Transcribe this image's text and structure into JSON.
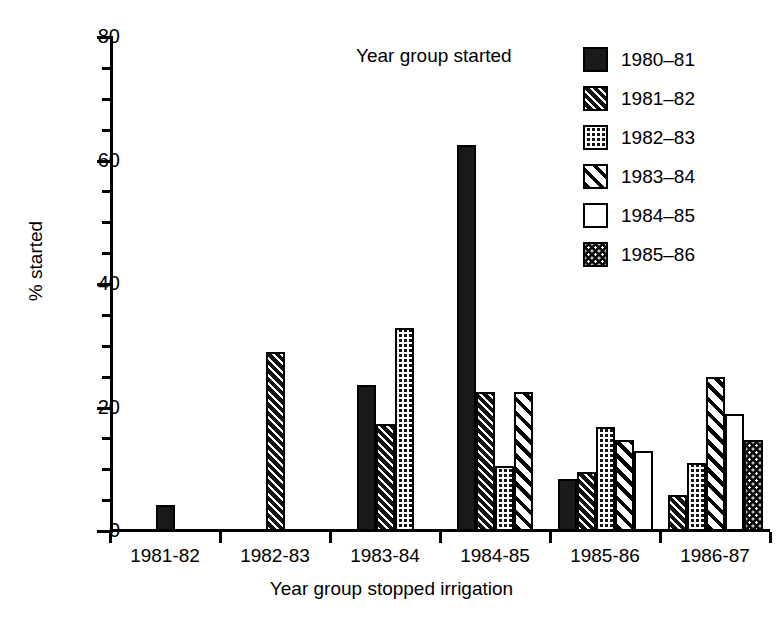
{
  "chart_data": {
    "type": "bar",
    "title": "",
    "xlabel": "Year group stopped irrigation",
    "ylabel": "% started",
    "ylim": [
      0,
      80
    ],
    "y_ticks_major": [
      0,
      20,
      40,
      60,
      80
    ],
    "y_tick_labels": [
      "0",
      "20",
      "40",
      "60",
      "80"
    ],
    "y_ticks_minor": [
      5,
      10,
      15,
      25,
      30,
      35,
      45,
      50,
      55,
      65,
      70,
      75
    ],
    "grid": false,
    "legend_position": "top-right",
    "legend_title": "Year group started",
    "categories": [
      "1981-82",
      "1982-83",
      "1983-84",
      "1984-85",
      "1985-86",
      "1986-87"
    ],
    "series": [
      {
        "name": "1980–81",
        "pattern": "solid",
        "values": [
          4.2,
          null,
          23.7,
          62.5,
          8.5,
          null
        ]
      },
      {
        "name": "1981–82",
        "pattern": "hatch-dark",
        "values": [
          null,
          29.0,
          17.4,
          22.5,
          9.5,
          5.8
        ]
      },
      {
        "name": "1982–83",
        "pattern": "checker",
        "values": [
          null,
          null,
          32.8,
          10.5,
          16.8,
          11.0
        ]
      },
      {
        "name": "1983–84",
        "pattern": "hatch-light",
        "values": [
          null,
          null,
          null,
          22.5,
          14.8,
          25.0
        ]
      },
      {
        "name": "1984–85",
        "pattern": "white",
        "values": [
          null,
          null,
          null,
          null,
          13.0,
          19.0
        ]
      },
      {
        "name": "1985–86",
        "pattern": "speckle",
        "values": [
          null,
          null,
          null,
          null,
          null,
          14.8
        ]
      }
    ]
  },
  "colors": {
    "axis": "#000000",
    "background": "#ffffff",
    "ink": "#1a1a1a"
  }
}
